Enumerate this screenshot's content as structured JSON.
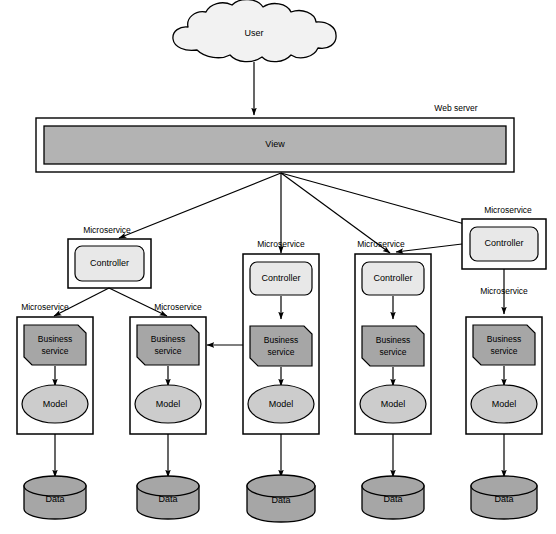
{
  "diagram": {
    "title_label": "User",
    "web_server_label": "Web server",
    "view_label": "View",
    "microservice_label": "Microservice",
    "controller_label": "Controller",
    "business_service_label_line1": "Business",
    "business_service_label_line2": "service",
    "model_label": "Model",
    "data_label": "Data",
    "caption": "",
    "colors": {
      "cloud_fill": "#f2f2f2",
      "view_fill": "#b3b3b3",
      "controller_fill": "#e8e8e8",
      "business_fill": "#a6a6a6",
      "model_fill": "#cccccc",
      "data_fill": "#a6a6a6",
      "stroke": "#000000",
      "background": "#ffffff"
    },
    "nodes": {
      "user_cloud": {
        "name": "User",
        "shape": "cloud"
      },
      "web_server": {
        "name": "Web server",
        "shape": "container"
      },
      "view": {
        "name": "View",
        "shape": "rect"
      }
    },
    "microservices": [
      {
        "id": "ms1",
        "label": "Microservice",
        "contains": [
          "Controller"
        ]
      },
      {
        "id": "ms2",
        "label": "Microservice",
        "contains": [
          "Business service",
          "Model"
        ]
      },
      {
        "id": "ms3",
        "label": "Microservice",
        "contains": [
          "Business service",
          "Model"
        ]
      },
      {
        "id": "ms4",
        "label": "Microservice",
        "contains": [
          "Controller",
          "Business service",
          "Model"
        ]
      },
      {
        "id": "ms5",
        "label": "Microservice",
        "contains": [
          "Controller",
          "Business service",
          "Model"
        ]
      },
      {
        "id": "ms6",
        "label": "Microservice",
        "contains": [
          "Controller"
        ]
      },
      {
        "id": "ms7",
        "label": "Microservice",
        "contains": [
          "Business service",
          "Model"
        ]
      }
    ],
    "datastores": [
      {
        "id": "db1",
        "label": "Data"
      },
      {
        "id": "db2",
        "label": "Data"
      },
      {
        "id": "db3",
        "label": "Data"
      },
      {
        "id": "db4",
        "label": "Data"
      },
      {
        "id": "db5",
        "label": "Data"
      }
    ],
    "edges": [
      {
        "from": "User",
        "to": "View"
      },
      {
        "from": "View",
        "to": "ms1.Controller"
      },
      {
        "from": "View",
        "to": "ms4.Controller"
      },
      {
        "from": "View",
        "to": "ms5.Controller"
      },
      {
        "from": "View",
        "to": "ms6.Controller"
      },
      {
        "from": "ms1.Controller",
        "to": "ms2.Business service"
      },
      {
        "from": "ms1.Controller",
        "to": "ms3.Business service"
      },
      {
        "from": "ms6.Controller",
        "to": "ms5.Controller"
      },
      {
        "from": "ms6.Controller",
        "to": "ms7.Business service"
      },
      {
        "from": "ms4.Business service",
        "to": "ms3.Business service"
      },
      {
        "from": "ms2.Model",
        "to": "db1"
      },
      {
        "from": "ms3.Model",
        "to": "db2"
      },
      {
        "from": "ms4.Model",
        "to": "db3"
      },
      {
        "from": "ms5.Model",
        "to": "db4"
      },
      {
        "from": "ms7.Model",
        "to": "db5"
      }
    ]
  }
}
